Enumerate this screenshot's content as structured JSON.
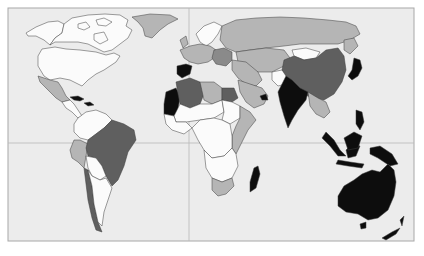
{
  "map": {
    "type": "choropleth-world-map",
    "colors": {
      "page_bg": "#ffffff",
      "ocean": "#ececec",
      "frame": "#a8a8a8",
      "gridline": "#b9b9b9",
      "border": "#3c3c3c",
      "shade_white": "#fbfbfb",
      "shade_light": "#b5b5b5",
      "shade_mid": "#8a8a8a",
      "shade_dark": "#5f5f5f",
      "shade_black": "#0d0d0d"
    },
    "frame": {
      "x": 8,
      "y": 8,
      "width": 406,
      "height": 233
    },
    "gridlines": {
      "vertical_x": 189,
      "horizontal_y": 143
    },
    "regions": [
      {
        "name": "alaska",
        "shade": "white"
      },
      {
        "name": "canada",
        "shade": "white"
      },
      {
        "name": "greenland",
        "shade": "light"
      },
      {
        "name": "usa",
        "shade": "white"
      },
      {
        "name": "mexico",
        "shade": "light"
      },
      {
        "name": "central-america",
        "shade": "white"
      },
      {
        "name": "caribbean-cuba-hispaniola",
        "shade": "black"
      },
      {
        "name": "northern-south-america",
        "shade": "white"
      },
      {
        "name": "peru",
        "shade": "light"
      },
      {
        "name": "brazil",
        "shade": "dark"
      },
      {
        "name": "bolivia-paraguay",
        "shade": "white"
      },
      {
        "name": "chile",
        "shade": "dark"
      },
      {
        "name": "argentina",
        "shade": "white"
      },
      {
        "name": "iberia",
        "shade": "black"
      },
      {
        "name": "western-europe",
        "shade": "light"
      },
      {
        "name": "scandinavia",
        "shade": "white"
      },
      {
        "name": "eastern-europe",
        "shade": "mid"
      },
      {
        "name": "russia",
        "shade": "light"
      },
      {
        "name": "algeria",
        "shade": "dark"
      },
      {
        "name": "morocco-west-sahara-mauritania",
        "shade": "black"
      },
      {
        "name": "libya",
        "shade": "light"
      },
      {
        "name": "egypt",
        "shade": "dark"
      },
      {
        "name": "sahel",
        "shade": "white"
      },
      {
        "name": "west-africa",
        "shade": "white"
      },
      {
        "name": "sudan",
        "shade": "white"
      },
      {
        "name": "east-africa",
        "shade": "light"
      },
      {
        "name": "central-africa",
        "shade": "white"
      },
      {
        "name": "southern-africa",
        "shade": "white"
      },
      {
        "name": "south-africa",
        "shade": "light"
      },
      {
        "name": "madagascar",
        "shade": "black"
      },
      {
        "name": "middle-east",
        "shade": "light"
      },
      {
        "name": "arabia",
        "shade": "light"
      },
      {
        "name": "central-asia",
        "shade": "light"
      },
      {
        "name": "afghanistan",
        "shade": "white"
      },
      {
        "name": "india",
        "shade": "black"
      },
      {
        "name": "mongolia",
        "shade": "white"
      },
      {
        "name": "china",
        "shade": "dark"
      },
      {
        "name": "japan",
        "shade": "black"
      },
      {
        "name": "southeast-asia",
        "shade": "light"
      },
      {
        "name": "indonesia",
        "shade": "black"
      },
      {
        "name": "philippines",
        "shade": "black"
      },
      {
        "name": "papua-new-guinea",
        "shade": "black"
      },
      {
        "name": "australia",
        "shade": "black"
      },
      {
        "name": "new-zealand",
        "shade": "black"
      }
    ]
  }
}
